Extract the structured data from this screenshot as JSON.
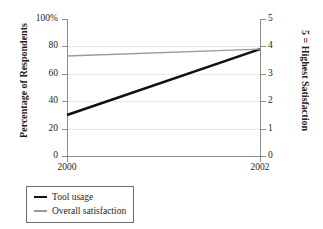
{
  "chart_data": {
    "type": "line",
    "title": "",
    "subtitle": "",
    "x": [
      "2000",
      "2002"
    ],
    "xlabel": "",
    "grid": true,
    "legend_position": "below-left",
    "axes": {
      "left": {
        "label": "Percentage of Respondents",
        "ticks": [
          "0",
          "20",
          "40",
          "60",
          "80",
          "100%"
        ],
        "tick_values": [
          0,
          20,
          40,
          60,
          80,
          100
        ],
        "range": [
          0,
          100
        ]
      },
      "right": {
        "label": "5 = Highest Satisfaction",
        "ticks": [
          "0",
          "1",
          "2",
          "3",
          "4",
          "5"
        ],
        "tick_values": [
          0,
          1,
          2,
          3,
          4,
          5
        ],
        "range": [
          0,
          5
        ]
      }
    },
    "series": [
      {
        "name": "Tool usage",
        "axis": "left",
        "color": "#111111",
        "width": 2.6,
        "values": [
          30,
          78
        ],
        "units": "percent"
      },
      {
        "name": "Overall satisfaction",
        "axis": "right",
        "color": "#9a9a9a",
        "width": 1.4,
        "values": [
          3.65,
          3.9
        ],
        "units": "rating"
      }
    ]
  },
  "legend": {
    "items": [
      {
        "label": "Tool usage",
        "swatch": "thick-black-line"
      },
      {
        "label": "Overall satisfaction",
        "swatch": "thin-gray-line"
      }
    ]
  },
  "colors": {
    "tool_usage": "#111111",
    "overall_satisfaction": "#9a9a9a",
    "axis": "#8d8d8d",
    "gridline": "#e9e9e9",
    "text": "#231f20",
    "background": "#ffffff"
  }
}
